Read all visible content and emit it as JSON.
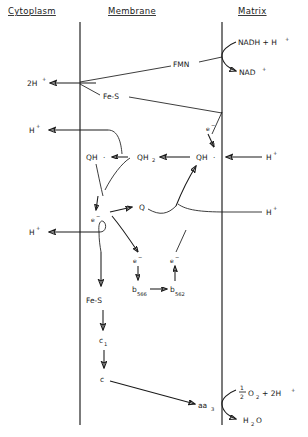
{
  "diagram": {
    "type": "biochemical-pathway",
    "style": "hand-drawn-schematic",
    "ink_color": "#1a1a1a",
    "background_color": "#ffffff"
  },
  "headers": {
    "cytoplasm": "Cytoplasm",
    "membrane": "Membrane",
    "matrix": "Matrix"
  },
  "compartments": {
    "left_boundary_label": "Cytoplasm",
    "right_boundary_label": "Matrix",
    "inner_label": "Membrane"
  },
  "labels": {
    "protons_out_top": "2H",
    "protons_out_top_charge": "+",
    "h_plus": "H",
    "charge_plus": "+",
    "fmn": "FMN",
    "fe_s_complex_i": "Fe-S",
    "fe_s_complex_iii": "Fe-S",
    "nadh": "NADH + H",
    "nadh_charge": "+",
    "nad": "NAD",
    "nad_charge": "+",
    "electron": "e",
    "electron_charge": "−",
    "qh_radical_left": "QH",
    "qh_radical_left_dot": "·",
    "qh2": "QH",
    "qh2_sub": "2",
    "qh_radical_right": "QH",
    "qh_radical_right_dot": "·",
    "quinone": "Q",
    "cyt_b566": "b",
    "cyt_b566_sub": "566",
    "cyt_b562": "b",
    "cyt_b562_sub": "562",
    "cyt_c1": "c",
    "cyt_c1_sub": "1",
    "cyt_c": "c",
    "cyt_aa3": "aa",
    "cyt_aa3_sub": "3",
    "oxygen_numerator": "1",
    "oxygen_denominator": "2",
    "oxygen": "O",
    "oxygen_sub": "2",
    "oxygen_plus_protons": "+ 2H",
    "oxygen_protons_charge": "+",
    "water": "H",
    "water_sub": "2",
    "water_o": "O"
  },
  "species_list": [
    "2H+",
    "H+",
    "FMN",
    "Fe-S",
    "NADH + H+",
    "NAD+",
    "e-",
    "QH·",
    "QH2",
    "Q",
    "b566",
    "b562",
    "c1",
    "c",
    "aa3",
    "1/2 O2 + 2H+",
    "H2O"
  ],
  "pathway_steps": [
    {
      "from": "NADH + H+",
      "to": "NAD+",
      "note": "Complex I entry, curved arrow at matrix boundary"
    },
    {
      "from": "FMN",
      "to": "2H+",
      "note": "proton pumped to cytoplasm"
    },
    {
      "from": "Fe-S",
      "to": "e-",
      "note": "electron to quinone pool"
    },
    {
      "from": "QH·",
      "to": "QH2",
      "note": "matrix side reduction with H+"
    },
    {
      "from": "QH2",
      "to": "QH·",
      "note": "cytoplasm side, releases H+"
    },
    {
      "from": "QH·",
      "to": "Q",
      "note": "Q cycle"
    },
    {
      "from": "e-",
      "to": "b566",
      "note": "cytochrome b566"
    },
    {
      "from": "b566",
      "to": "b562",
      "note": "cytochrome b562"
    },
    {
      "from": "b562",
      "to": "e-",
      "note": "returns to QH·"
    },
    {
      "from": "Fe-S",
      "to": "c1",
      "note": "Rieske to cytochrome c1"
    },
    {
      "from": "c1",
      "to": "c",
      "note": "cytochrome c"
    },
    {
      "from": "c",
      "to": "aa3",
      "note": "cytochrome oxidase"
    },
    {
      "from": "1/2 O2 + 2H+",
      "to": "H2O",
      "note": "terminal reduction in matrix"
    }
  ]
}
